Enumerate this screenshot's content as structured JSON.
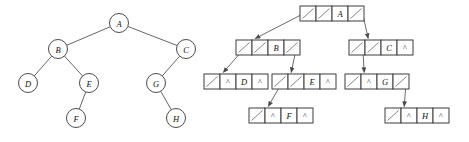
{
  "figure": {
    "background_color": "#ffffff",
    "stroke_color": "#555555",
    "width": 469,
    "height": 142
  },
  "left_diagram": {
    "name": "abstract-binary-tree",
    "caption": "",
    "null_glyph": "^",
    "nodes": [
      {
        "id": "A",
        "label": "A",
        "cx": 119,
        "cy": 23,
        "r": 9.5
      },
      {
        "id": "B",
        "label": "B",
        "cx": 58,
        "cy": 49,
        "r": 9.5
      },
      {
        "id": "C",
        "label": "C",
        "cx": 186,
        "cy": 49,
        "r": 9.5
      },
      {
        "id": "D",
        "label": "D",
        "cx": 28,
        "cy": 83,
        "r": 9.5
      },
      {
        "id": "E",
        "label": "E",
        "cx": 89,
        "cy": 83,
        "r": 9.5
      },
      {
        "id": "G",
        "label": "G",
        "cx": 156,
        "cy": 83,
        "r": 9.5
      },
      {
        "id": "F",
        "label": "F",
        "cx": 76,
        "cy": 118,
        "r": 9.5
      },
      {
        "id": "H",
        "label": "H",
        "cx": 176,
        "cy": 118,
        "r": 9.5
      }
    ],
    "edges": [
      {
        "from": "A",
        "to": "B"
      },
      {
        "from": "A",
        "to": "C"
      },
      {
        "from": "B",
        "to": "D"
      },
      {
        "from": "B",
        "to": "E"
      },
      {
        "from": "E",
        "to": "F"
      },
      {
        "from": "C",
        "to": "G"
      },
      {
        "from": "G",
        "to": "H"
      }
    ]
  },
  "right_diagram": {
    "name": "linked-node-representation",
    "caption": "",
    "null_glyph": "^",
    "cell_width": 16,
    "cell_height": 15,
    "nodes": [
      {
        "id": "A",
        "label": "A",
        "x": 300,
        "y": 6,
        "cells": [
          "ptr",
          "ptr",
          "A",
          "ptr"
        ],
        "left_child": "B",
        "right_child": "C"
      },
      {
        "id": "B",
        "label": "B",
        "x": 236,
        "y": 40,
        "cells": [
          "ptr",
          "ptr",
          "B",
          "ptr"
        ],
        "left_child": "D",
        "right_child": "E"
      },
      {
        "id": "C",
        "label": "C",
        "x": 349,
        "y": 40,
        "cells": [
          "ptr",
          "ptr",
          "C",
          "^"
        ],
        "left_child": "G",
        "right_child": null
      },
      {
        "id": "D",
        "label": "D",
        "x": 204,
        "y": 74,
        "cells": [
          "ptr",
          "^",
          "D",
          "^"
        ],
        "left_child": null,
        "right_child": null
      },
      {
        "id": "E",
        "label": "E",
        "x": 272,
        "y": 74,
        "cells": [
          "ptr",
          "ptr",
          "E",
          "^"
        ],
        "left_child": "F",
        "right_child": null
      },
      {
        "id": "G",
        "label": "G",
        "x": 345,
        "y": 74,
        "cells": [
          "ptr",
          "^",
          "G",
          "ptr"
        ],
        "left_child": null,
        "right_child": "H"
      },
      {
        "id": "F",
        "label": "F",
        "x": 249,
        "y": 108,
        "cells": [
          "ptr",
          "^",
          "F",
          "^"
        ],
        "left_child": null,
        "right_child": null
      },
      {
        "id": "H",
        "label": "H",
        "x": 385,
        "y": 108,
        "cells": [
          "ptr",
          "^",
          "H",
          "^"
        ],
        "left_child": null,
        "right_child": null
      }
    ],
    "links": [
      {
        "from": "A",
        "to": "B",
        "side": "left"
      },
      {
        "from": "A",
        "to": "C",
        "side": "right"
      },
      {
        "from": "B",
        "to": "D",
        "side": "left"
      },
      {
        "from": "B",
        "to": "E",
        "side": "right"
      },
      {
        "from": "C",
        "to": "G",
        "side": "left"
      },
      {
        "from": "E",
        "to": "F",
        "side": "left"
      },
      {
        "from": "G",
        "to": "H",
        "side": "right"
      }
    ]
  }
}
